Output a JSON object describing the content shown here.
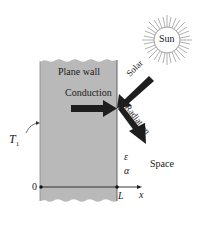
{
  "diagram": {
    "wall_label": "Plane wall",
    "conduction_label": "Conduction",
    "solar_label": "Solar",
    "radiation_label": "Radiation",
    "sun_label": "Sun",
    "space_label": "Space",
    "temperature_label": "T",
    "temperature_subscript": "1",
    "emissivity_symbol": "ε",
    "absorptivity_symbol": "α",
    "axis_origin_label": "0",
    "axis_end_label": "L",
    "axis_var_label": "x",
    "colors": {
      "wall": "#b9b9b9",
      "arrow": "#1e1e1e",
      "sun_rays": "#7a7a7a"
    }
  }
}
